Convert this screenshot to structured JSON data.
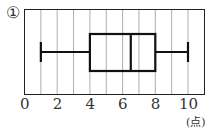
{
  "label_number": "①",
  "unit_label": "(点)",
  "chart_data": {
    "type": "boxplot",
    "title": "",
    "xlabel": "(点)",
    "ylabel": "",
    "xlim": [
      0,
      11
    ],
    "xticks": [
      0,
      2,
      4,
      6,
      8,
      10
    ],
    "tick_labels": [
      "0",
      "2",
      "4",
      "6",
      "8",
      "10"
    ],
    "grid": true,
    "grid_interval": 1,
    "box": {
      "min": 1,
      "q1": 4,
      "median": 6.5,
      "q3": 8,
      "max": 10
    }
  }
}
